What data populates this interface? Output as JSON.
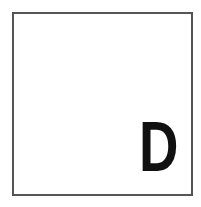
{
  "card": {
    "letter": "D",
    "border_color": "#555555",
    "letter_color": "#111111",
    "background": "#ffffff"
  }
}
